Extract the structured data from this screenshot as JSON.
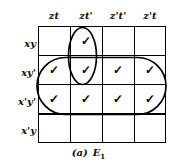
{
  "figure": {
    "type": "karnaugh-map",
    "caption_label": "(a)",
    "caption_name": "E",
    "caption_subscript": "1",
    "columns": [
      "zt",
      "zt'",
      "z't'",
      "z't"
    ],
    "rows": [
      "xy",
      "xy'",
      "x'y'",
      "x'y"
    ],
    "check_glyph": "✓",
    "cells": [
      [
        false,
        true,
        false,
        false
      ],
      [
        true,
        true,
        true,
        true
      ],
      [
        true,
        true,
        true,
        true
      ],
      [
        false,
        false,
        false,
        false
      ]
    ],
    "loops": [
      {
        "name": "vertical-loop",
        "shape": "ellipse",
        "covers_rows": [
          0,
          1
        ],
        "covers_cols": [
          1
        ]
      },
      {
        "name": "horizontal-loop",
        "shape": "stadium",
        "covers_rows": [
          1,
          2
        ],
        "covers_cols": [
          0,
          1,
          2,
          3
        ]
      }
    ],
    "line_color": "#000000",
    "background_color": "#ffffff"
  }
}
